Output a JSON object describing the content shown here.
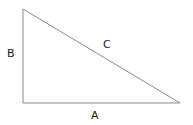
{
  "diagram": {
    "type": "right-triangle",
    "vertices": {
      "top": [
        23,
        9
      ],
      "right_angle": [
        23,
        103
      ],
      "right": [
        180,
        103
      ]
    },
    "sides": [
      {
        "id": "A",
        "label": "A",
        "description": "base"
      },
      {
        "id": "B",
        "label": "B",
        "description": "vertical leg"
      },
      {
        "id": "C",
        "label": "C",
        "description": "hypotenuse"
      }
    ],
    "stroke_color": "#888888",
    "label_color": "#222222"
  }
}
